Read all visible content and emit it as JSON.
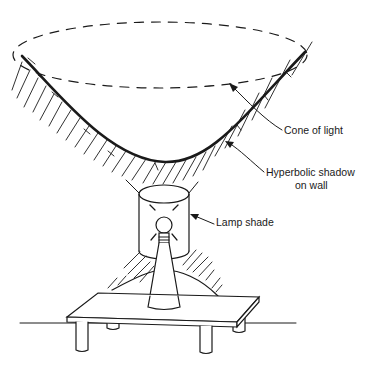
{
  "figure": {
    "type": "illustration"
  },
  "labels": {
    "cone_of_light": "Cone of light",
    "hyperbolic_shadow_line1": "Hyperbolic shadow",
    "hyperbolic_shadow_line2": "on wall",
    "lamp_shade": "Lamp shade"
  },
  "colors": {
    "ink": "#1a1a1a",
    "background": "#ffffff"
  }
}
